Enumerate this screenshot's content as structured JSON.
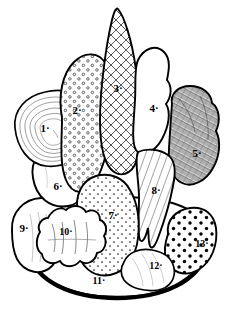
{
  "figure": {
    "style": "black ink line drawing on white background",
    "background_color": "#ffffff",
    "ink_color": "#000000",
    "width": 233,
    "height": 318,
    "label_style": "handwritten numerals each followed by a small period"
  },
  "labels": [
    {
      "id": 1,
      "text": "1·",
      "x": 45,
      "y": 128,
      "region": "layered-concentric-item",
      "texture": "concentric contour lines"
    },
    {
      "id": 2,
      "text": "2·",
      "x": 77,
      "y": 110,
      "region": "open-circle-stippled-mound",
      "texture": "small open circles"
    },
    {
      "id": 3,
      "text": "3·",
      "x": 118,
      "y": 88,
      "region": "tall-cone",
      "texture": "cross-hatching"
    },
    {
      "id": 4,
      "text": "4·",
      "x": 154,
      "y": 108,
      "region": "plain-rounded-lobe",
      "texture": "blank / unshaded"
    },
    {
      "id": 5,
      "text": "5·",
      "x": 197,
      "y": 153,
      "region": "rough-textured-blob",
      "texture": "dense scribbled hatching"
    },
    {
      "id": 6,
      "text": "6·",
      "x": 58,
      "y": 186,
      "region": "plain-left-mound",
      "texture": "blank / unshaded"
    },
    {
      "id": 7,
      "text": "7·",
      "x": 113,
      "y": 215,
      "region": "dot-stippled-mound",
      "texture": "fine filled dots"
    },
    {
      "id": 8,
      "text": "8·",
      "x": 156,
      "y": 190,
      "region": "tapering-leaf-blade",
      "texture": "parallel diagonal lines"
    },
    {
      "id": 9,
      "text": "9·",
      "x": 24,
      "y": 228,
      "region": "plain-left-lobe",
      "texture": "blank / unshaded"
    },
    {
      "id": 10,
      "text": "10·",
      "x": 66,
      "y": 232,
      "region": "irregular-lumpy-piece",
      "texture": "outlined lumps, light shading"
    },
    {
      "id": 11,
      "text": "11·",
      "x": 99,
      "y": 281,
      "region": "plate-base",
      "texture": "blank plate surface"
    },
    {
      "id": 12,
      "text": "12·",
      "x": 156,
      "y": 266,
      "region": "plain-lower-right-lobe",
      "texture": "faint light lines"
    },
    {
      "id": 13,
      "text": "13·",
      "x": 202,
      "y": 244,
      "region": "bold-dotted-round-item",
      "texture": "bold dark dots"
    }
  ]
}
